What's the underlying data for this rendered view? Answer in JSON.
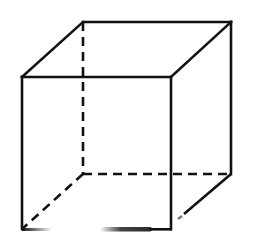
{
  "diagram": {
    "type": "wireframe-cube",
    "stroke_color": "#111111",
    "background": "#ffffff",
    "stroke_width": 2.6,
    "vertices": {
      "front_top_left": [
        22,
        77
      ],
      "front_top_right": [
        171,
        77
      ],
      "front_bottom_left": [
        22,
        229
      ],
      "front_bottom_right": [
        171,
        229
      ],
      "back_top_left": [
        83,
        22
      ],
      "back_top_right": [
        231,
        22
      ],
      "back_bottom_left": [
        83,
        174
      ],
      "back_bottom_right": [
        231,
        174
      ]
    },
    "solid_edges": [
      [
        "front_top_left",
        "front_top_right"
      ],
      [
        "front_top_left",
        "front_bottom_left"
      ],
      [
        "front_top_right",
        "front_bottom_right"
      ],
      [
        "back_top_left",
        "back_top_right"
      ],
      [
        "front_top_left",
        "back_top_left"
      ],
      [
        "front_top_right",
        "back_top_right"
      ],
      [
        "back_top_right",
        "back_bottom_right"
      ]
    ],
    "dashed_edges": [
      [
        "back_top_left",
        "back_bottom_left"
      ],
      [
        "back_bottom_left",
        "back_bottom_right"
      ],
      [
        "back_bottom_left",
        "front_bottom_left"
      ]
    ],
    "partial_edges": {
      "bottom_right_diagonal": [
        [
          231,
          174
        ],
        [
          181,
          217
        ]
      ],
      "bottom_front_segments": [
        [
          [
            22,
            229
          ],
          [
            48,
            229
          ]
        ],
        [
          [
            100,
            229
          ],
          [
            150,
            229
          ]
        ],
        [
          [
            150,
            229
          ],
          [
            171,
            229
          ]
        ]
      ]
    }
  }
}
